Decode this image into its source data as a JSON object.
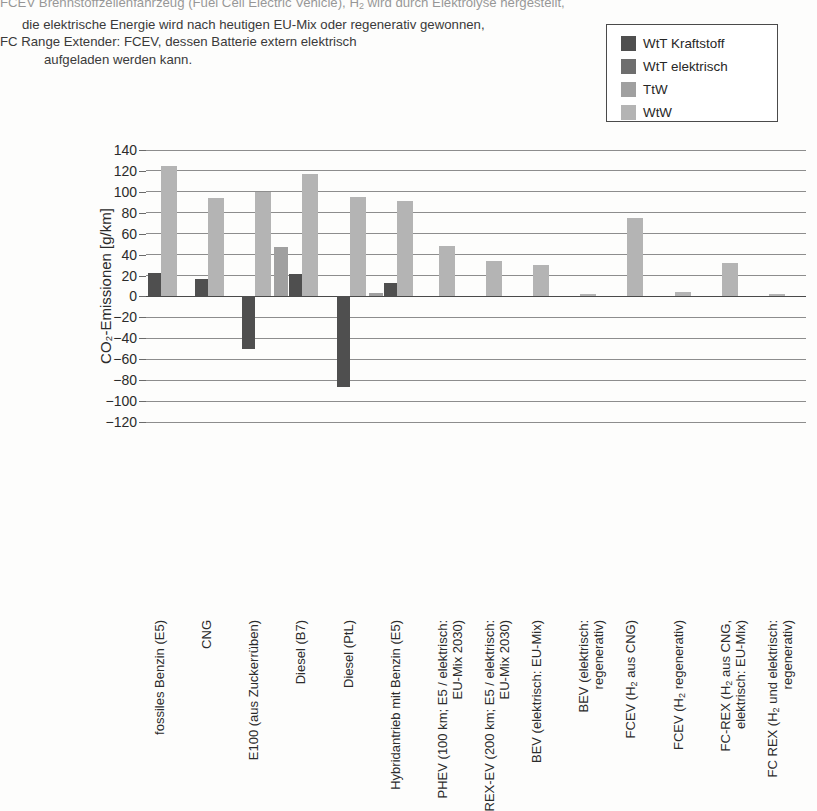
{
  "caption": {
    "lines": [
      {
        "text": "FCEV Brennstoffzellenfahrzeug (Fuel Cell Electric Vehicle), H₂ wird durch Elektrolyse hergestellt,",
        "indent": 0,
        "clipped": true
      },
      {
        "text": "die elektrische Energie wird nach heutigen EU-Mix oder regenerativ gewonnen,",
        "indent": 1,
        "clipped": false
      },
      {
        "text": "FC Range Extender: FCEV, dessen Batterie extern elektrisch",
        "indent": 0,
        "clipped": false
      },
      {
        "text": "aufgeladen werden kann.",
        "indent": 2,
        "clipped": false
      }
    ]
  },
  "legend": {
    "items": [
      {
        "label": "WtT Kraftstoff",
        "color": "#4f4f4f"
      },
      {
        "label": "WtT elektrisch",
        "color": "#6e6e6e"
      },
      {
        "label": "TtW",
        "color": "#a0a0a0"
      },
      {
        "label": "WtW",
        "color": "#b4b4b4"
      }
    ]
  },
  "chart_data": {
    "type": "bar",
    "title": "",
    "xlabel": "",
    "ylabel": "CO₂-Emissionen [g/km]",
    "ylim": [
      -120,
      140
    ],
    "yticks": [
      140,
      120,
      100,
      80,
      60,
      40,
      20,
      0,
      -20,
      -40,
      -60,
      -80,
      -100,
      -120
    ],
    "ytick_labels": [
      "140",
      "120",
      "100",
      "80",
      "60",
      "40",
      "20",
      "0",
      "−20",
      "−40",
      "−60",
      "−80",
      "−100",
      "−120"
    ],
    "grid": true,
    "legend_position": "top-right",
    "categories": [
      {
        "lines": [
          "fossiles Benzin (E5)"
        ]
      },
      {
        "lines": [
          "CNG"
        ]
      },
      {
        "lines": [
          "E100 (aus Zuckerrüben)"
        ]
      },
      {
        "lines": [
          "Diesel (B7)"
        ]
      },
      {
        "lines": [
          "Diesel (PtL)"
        ]
      },
      {
        "lines": [
          "Hybridantrieb mit Benzin (E5)"
        ]
      },
      {
        "lines": [
          "PHEV (100 km; E5 / elektrisch:",
          "EU-Mix 2030)"
        ]
      },
      {
        "lines": [
          "REX-EV (200 km; E5 / elektrisch:",
          "EU-Mix 2030)"
        ]
      },
      {
        "lines": [
          "BEV (elektrisch: EU-Mix)"
        ]
      },
      {
        "lines": [
          "BEV (elektrisch:",
          "regenerativ)"
        ]
      },
      {
        "lines": [
          "FCEV (H₂ aus CNG)"
        ]
      },
      {
        "lines": [
          "FCEV (H₂ regenerativ)"
        ]
      },
      {
        "lines": [
          "FC-REX (H₂ aus CNG,",
          "elektrisch: EU-Mix)"
        ]
      },
      {
        "lines": [
          "FC REX (H₂ und elektrisch:",
          "regenerativ)"
        ]
      }
    ],
    "series": [
      {
        "name": "WtT Kraftstoff",
        "color": "#4f4f4f",
        "values": [
          22,
          17,
          -50,
          21,
          -87,
          13,
          null,
          null,
          null,
          null,
          null,
          null,
          null,
          null
        ]
      },
      {
        "name": "WtT elektrisch",
        "color": "#6e6e6e",
        "values": [
          null,
          null,
          null,
          null,
          null,
          null,
          null,
          null,
          null,
          null,
          null,
          null,
          null,
          null
        ]
      },
      {
        "name": "TtW",
        "color": "#a0a0a0",
        "values": [
          null,
          null,
          47,
          null,
          3,
          null,
          null,
          null,
          null,
          null,
          null,
          null,
          null,
          null
        ]
      },
      {
        "name": "WtW",
        "color": "#b4b4b4",
        "values": [
          125,
          94,
          100,
          117,
          95,
          91,
          48,
          34,
          30,
          2,
          75,
          4,
          32,
          2
        ]
      }
    ]
  }
}
